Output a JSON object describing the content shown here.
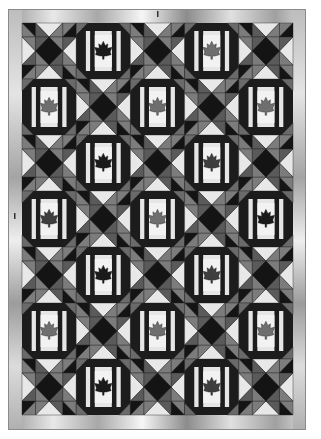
{
  "image": {
    "title": "Maple leaf quilt pattern",
    "description": "Quilt with alternating maple leaf blocks and hourglass (quarter-square triangle) blocks, framed by a metallic gray border"
  },
  "quilt": {
    "columns": 5,
    "rows": 7,
    "colors": {
      "sashing": "#1c1c1c",
      "frame_light": "#e6e6e6",
      "leaf_background": "#f2f2f2",
      "corner_gray": "#6a6a6a",
      "hourglass_light": "#e8e8e8",
      "hourglass_gray": "#5a5a5a",
      "hourglass_mid": "#7c7c7c",
      "hourglass_dark": "#141414",
      "border_base": "#b8b8b8",
      "border_highlight": "#f4f4f4",
      "border_shadow": "#6e6e6e"
    },
    "leaf_shades": {
      "black": "#1a1a1a",
      "dark": "#3e3e3e",
      "gray": "#6e6e6e"
    },
    "blocks": [
      [
        "hourglass",
        "leaf:black",
        "hourglass",
        "leaf:gray",
        "hourglass"
      ],
      [
        "leaf:gray",
        "hourglass",
        "leaf:gray",
        "hourglass",
        "leaf:gray"
      ],
      [
        "hourglass",
        "leaf:black",
        "hourglass",
        "leaf:dark",
        "hourglass"
      ],
      [
        "leaf:dark",
        "hourglass",
        "leaf:gray",
        "hourglass",
        "leaf:black"
      ],
      [
        "hourglass",
        "leaf:black",
        "hourglass",
        "leaf:dark",
        "hourglass"
      ],
      [
        "leaf:gray",
        "hourglass",
        "leaf:gray",
        "hourglass",
        "leaf:gray"
      ],
      [
        "hourglass",
        "leaf:black",
        "hourglass",
        "leaf:dark",
        "hourglass"
      ]
    ]
  }
}
